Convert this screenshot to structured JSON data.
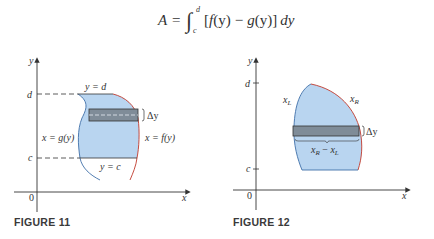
{
  "formula": {
    "lhs": "A",
    "equals": "=",
    "integral": "∫",
    "upper_limit": "d",
    "lower_limit": "c",
    "integrand": "[f(y) − g(y)] dy",
    "integrand_parts": {
      "open": "[",
      "f": "f",
      "fy": "(y)",
      "minus": "−",
      "g": "g",
      "gy": "(y)",
      "close": "]",
      "d": "dy"
    }
  },
  "figure11": {
    "caption": "FIGURE 11",
    "axis_y_label": "y",
    "axis_x_label": "x",
    "origin_label": "0",
    "tick_d": "d",
    "tick_c": "c",
    "top_boundary_label": "y = d",
    "bottom_boundary_label": "y = c",
    "left_curve_label": "x = g(y)",
    "right_curve_label": "x = f(y)",
    "strip_label": "Δy"
  },
  "figure12": {
    "caption": "FIGURE 12",
    "axis_y_label": "y",
    "axis_x_label": "x",
    "origin_label": "0",
    "tick_d": "d",
    "tick_c": "c",
    "left_curve_label": "x",
    "left_curve_sub": "L",
    "right_curve_label": "x",
    "right_curve_sub": "R",
    "strip_label": "Δy",
    "width_label_a": "x",
    "width_label_a_sub": "R",
    "width_label_minus": " − ",
    "width_label_b": "x",
    "width_label_b_sub": "L"
  },
  "colors": {
    "region_fill": "#b9d5f0",
    "strip_fill": "#7f8c98",
    "right_curve": "#c0392b",
    "left_curve": "#3f6fa8",
    "axis": "#333333"
  }
}
